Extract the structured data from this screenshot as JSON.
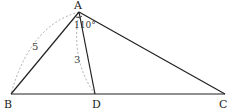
{
  "diagram": {
    "points": {
      "A": {
        "label": "A",
        "x": 79,
        "y": 12
      },
      "B": {
        "label": "B",
        "x": 11,
        "y": 94
      },
      "D": {
        "label": "D",
        "x": 95,
        "y": 94
      },
      "C": {
        "label": "C",
        "x": 225,
        "y": 94
      }
    },
    "measurements": {
      "AB": "5",
      "AD": "3",
      "angle_BAC": "110°"
    },
    "colors": {
      "line": "#222222",
      "dashed_arc": "#999999"
    }
  }
}
